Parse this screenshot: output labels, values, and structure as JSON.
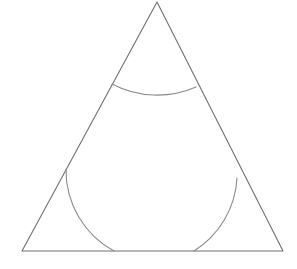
{
  "figure": {
    "background_color": "#ffffff",
    "canvas": {
      "width": 297,
      "height": 269
    },
    "stroke": {
      "triangle_color": "#6f6f6f",
      "arc_color": "#8a8a8a",
      "triangle_width": 1.1,
      "arc_width": 1.1
    },
    "vertices": {
      "apex": {
        "label": "A",
        "x": 157,
        "y": 2
      },
      "bottom_left": {
        "label": "B",
        "x": 22,
        "y": 251
      },
      "bottom_right": {
        "label": "C",
        "x": 283,
        "y": 251
      }
    },
    "edges": [
      {
        "name": "left-side",
        "from": "apex",
        "to": "bottom_left"
      },
      {
        "name": "right-side",
        "from": "apex",
        "to": "bottom_right"
      },
      {
        "name": "base",
        "from": "bottom_left",
        "to": "bottom_right"
      }
    ],
    "arcs": [
      {
        "name": "apex-arc",
        "center_vertex": "apex",
        "radius": 97,
        "start": {
          "x": 112,
          "y": 84
        },
        "end": {
          "x": 196,
          "y": 87
        },
        "sweep": "concave-toward-apex",
        "lowest_point": {
          "x": 155,
          "y": 99
        }
      },
      {
        "name": "bottom-left-arc",
        "center_vertex": "bottom_left",
        "radius": 92,
        "start": {
          "x": 66,
          "y": 169
        },
        "end": {
          "x": 114,
          "y": 251
        },
        "sweep": "concave-toward-bottom-left",
        "apex_point": {
          "x": 98,
          "y": 196
        }
      },
      {
        "name": "bottom-right-arc",
        "center_vertex": "bottom_right",
        "radius": 92,
        "start": {
          "x": 194,
          "y": 251
        },
        "end": {
          "x": 237,
          "y": 178
        },
        "sweep": "concave-toward-bottom-right",
        "apex_point": {
          "x": 210,
          "y": 198
        }
      }
    ],
    "path_data": {
      "triangle": "M 157 2 L 22 251 L 283 251 Z",
      "apex_arc": "M 112 84 A 97 97 0 0 0 196 87",
      "bottom_left_arc": "M 66 169 A 92 92 0 0 0 114 251",
      "bottom_right_arc": "M 194 251 A 92 92 0 0 0 237 178"
    }
  }
}
